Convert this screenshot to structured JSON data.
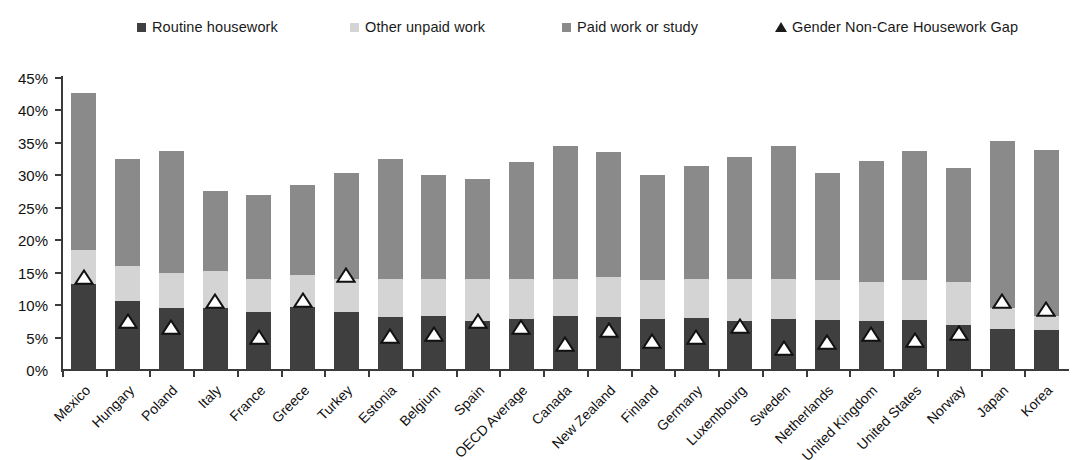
{
  "legend": {
    "items": [
      {
        "label": "Routine housework",
        "marker": "square",
        "color": "#3f3f3f",
        "x": 137
      },
      {
        "label": "Other unpaid work",
        "marker": "square",
        "color": "#d4d4d4",
        "x": 350
      },
      {
        "label": "Paid work or study",
        "marker": "square",
        "color": "#8a8a8a",
        "x": 562
      },
      {
        "label": "Gender Non-Care Housework Gap",
        "marker": "triangle",
        "color": "#1a1a1a",
        "x": 775
      }
    ]
  },
  "axis": {
    "y_ticks": [
      "0%",
      "5%",
      "10%",
      "15%",
      "20%",
      "25%",
      "30%",
      "35%",
      "40%",
      "45%"
    ],
    "y_min": 0,
    "y_max": 45,
    "y_step": 5
  },
  "chart_data": {
    "type": "bar",
    "stacked": true,
    "title": "",
    "xlabel": "",
    "ylabel": "",
    "ylim": [
      0,
      45
    ],
    "grid": false,
    "legend_position": "top",
    "categories": [
      "Mexico",
      "Hungary",
      "Poland",
      "Italy",
      "France",
      "Greece",
      "Turkey",
      "Estonia",
      "Belgium",
      "Spain",
      "OECD Average",
      "Canada",
      "New Zealand",
      "Finland",
      "Germany",
      "Luxembourg",
      "Sweden",
      "Netherlands",
      "United Kingdom",
      "United States",
      "Norway",
      "Japan",
      "Korea"
    ],
    "series": [
      {
        "name": "Routine housework",
        "color": "#3f3f3f",
        "values": [
          13.3,
          10.6,
          9.5,
          9.6,
          9.0,
          9.7,
          9.0,
          8.2,
          8.3,
          7.6,
          7.8,
          8.3,
          8.1,
          7.8,
          8.0,
          7.5,
          7.8,
          7.7,
          7.6,
          7.7,
          7.0,
          6.3,
          6.2
        ]
      },
      {
        "name": "Other unpaid work",
        "color": "#d4d4d4",
        "values": [
          5.2,
          5.4,
          5.5,
          5.6,
          5.1,
          5.0,
          5.0,
          5.8,
          5.8,
          6.4,
          6.2,
          5.8,
          6.2,
          6.1,
          6.1,
          6.6,
          6.3,
          6.1,
          5.9,
          6.2,
          6.5,
          3.2,
          2.1
        ]
      },
      {
        "name": "Paid work or study",
        "color": "#8a8a8a",
        "values": [
          24.2,
          16.5,
          18.8,
          12.4,
          12.8,
          13.8,
          16.3,
          18.5,
          15.9,
          15.4,
          18.0,
          20.4,
          19.3,
          16.1,
          17.3,
          18.8,
          20.5,
          16.5,
          18.7,
          19.8,
          17.6,
          25.8,
          25.6
        ]
      }
    ],
    "marker_series": {
      "name": "Gender Non-Care Housework Gap",
      "marker": "triangle",
      "color": "#ffffff",
      "outline": "#111111",
      "values": [
        13.3,
        6.4,
        5.6,
        9.6,
        4.0,
        9.7,
        13.6,
        4.1,
        4.4,
        6.4,
        5.6,
        2.9,
        5.1,
        3.4,
        4.0,
        5.7,
        2.3,
        3.3,
        4.4,
        3.6,
        4.6,
        9.5,
        8.3
      ]
    },
    "totals": [
      42.7,
      32.5,
      33.8,
      27.6,
      26.9,
      28.5,
      30.3,
      32.5,
      30.0,
      29.4,
      32.0,
      34.5,
      33.6,
      30.0,
      31.4,
      32.9,
      34.6,
      30.3,
      32.2,
      33.7,
      31.1,
      35.3,
      33.9
    ]
  }
}
